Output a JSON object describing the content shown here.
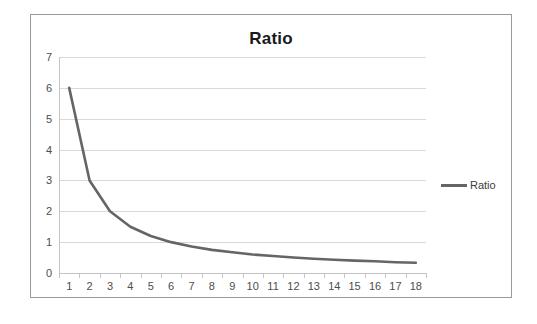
{
  "chart_data": {
    "type": "line",
    "title": "Ratio",
    "xlabel": "",
    "ylabel": "",
    "x": [
      1,
      2,
      3,
      4,
      5,
      6,
      7,
      8,
      9,
      10,
      11,
      12,
      13,
      14,
      15,
      16,
      17,
      18
    ],
    "categories": [
      "1",
      "2",
      "3",
      "4",
      "5",
      "6",
      "7",
      "8",
      "9",
      "10",
      "11",
      "12",
      "13",
      "14",
      "15",
      "16",
      "17",
      "18"
    ],
    "series": [
      {
        "name": "Ratio",
        "color": "#656565",
        "values": [
          6.0,
          3.0,
          2.0,
          1.5,
          1.2,
          1.0,
          0.86,
          0.75,
          0.67,
          0.6,
          0.55,
          0.5,
          0.46,
          0.43,
          0.4,
          0.38,
          0.35,
          0.33
        ]
      }
    ],
    "ylim": [
      0,
      7
    ],
    "y_ticks": [
      0,
      1,
      2,
      3,
      4,
      5,
      6,
      7
    ],
    "y_tick_labels": [
      "0",
      "1",
      "2",
      "3",
      "4",
      "5",
      "6",
      "7"
    ],
    "grid": true,
    "grid_color": "#d9d9d9",
    "legend": {
      "position": "right",
      "entries": [
        {
          "label": "Ratio",
          "color": "#656565"
        }
      ]
    },
    "frame_border_color": "#9a9a9a",
    "axis_color": "#c4c4c4",
    "background": "#ffffff"
  }
}
